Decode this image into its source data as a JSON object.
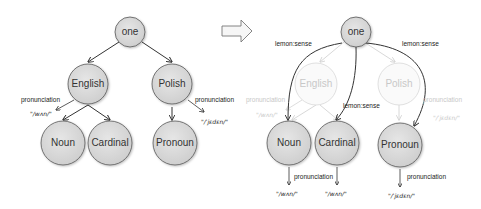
{
  "left_diagram": {
    "nodes": {
      "one": "one",
      "english": "English",
      "polish": "Polish",
      "noun": "Noun",
      "cardinal": "Cardinal",
      "pronoun": "Pronoun"
    },
    "edge_labels": {
      "english_pronunciation": "pronunciation",
      "polish_pronunciation": "pronunciation"
    },
    "values": {
      "english_pron": "\"/wʌn/\"",
      "polish_pron": "\"/ˈjɛdɛn/\""
    }
  },
  "transform_arrow": "arrow-right",
  "right_diagram": {
    "nodes": {
      "one": "one",
      "english": "English",
      "polish": "Polish",
      "noun": "Noun",
      "cardinal": "Cardinal",
      "pronoun": "Pronoun"
    },
    "edge_labels": {
      "sense_left": "lemon:sense",
      "sense_right": "lemon:sense",
      "sense_middle": "lemon:sense",
      "english_pronunciation": "pronunciation",
      "polish_pronunciation": "pronunciation",
      "noun_pronunciation": "pronunciation",
      "pronoun_pronunciation": "pronunciation"
    },
    "values": {
      "english_pron": "\"/wʌn/\"",
      "polish_pron": "\"/ˈjɛdɛn/\"",
      "noun_pron": "\"/wʌn/\"",
      "cardinal_pron": "\"/wʌn/\"",
      "pronoun_pron": "\"/ˈjɛdɛn/\""
    }
  }
}
